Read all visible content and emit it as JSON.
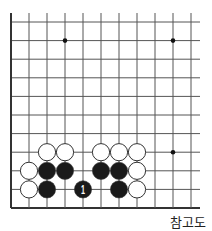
{
  "diagram": {
    "type": "go-board-fragment",
    "caption": "참고도",
    "grid": {
      "columns": 11,
      "rows": 11,
      "x0": 11,
      "y0": 22,
      "dx": 18,
      "dy": 18.6,
      "right_extension": 9,
      "top_extension": 9,
      "edges": {
        "left": true,
        "bottom": true,
        "top": false,
        "right": false
      },
      "line_color": "#555555",
      "edge_color": "#333333"
    },
    "star_points": [
      {
        "col": 3,
        "row": 1
      },
      {
        "col": 9,
        "row": 1
      },
      {
        "col": 9,
        "row": 7
      }
    ],
    "stones": [
      {
        "color": "white",
        "col": 2,
        "row": 7
      },
      {
        "color": "white",
        "col": 3,
        "row": 7
      },
      {
        "color": "white",
        "col": 5,
        "row": 7
      },
      {
        "color": "white",
        "col": 6,
        "row": 7
      },
      {
        "color": "white",
        "col": 7,
        "row": 7
      },
      {
        "color": "white",
        "col": 1,
        "row": 8
      },
      {
        "color": "black",
        "col": 2,
        "row": 8
      },
      {
        "color": "black",
        "col": 3,
        "row": 8
      },
      {
        "color": "black",
        "col": 5,
        "row": 8
      },
      {
        "color": "black",
        "col": 6,
        "row": 8
      },
      {
        "color": "white",
        "col": 7,
        "row": 8
      },
      {
        "color": "white",
        "col": 1,
        "row": 9
      },
      {
        "color": "black",
        "col": 2,
        "row": 9
      },
      {
        "color": "black",
        "col": 4,
        "row": 9,
        "label": "1"
      },
      {
        "color": "black",
        "col": 6,
        "row": 9
      },
      {
        "color": "white",
        "col": 7,
        "row": 9
      }
    ],
    "colors": {
      "black": "#1a1a1a",
      "white": "#ffffff",
      "stone_outline": "#333333",
      "label_on_black": "#ffffff"
    }
  }
}
